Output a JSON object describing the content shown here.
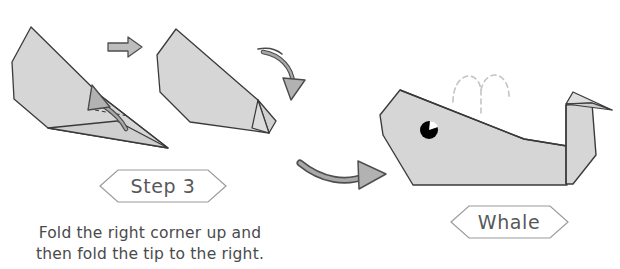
{
  "page": {
    "background_color": "#ffffff",
    "width": 620,
    "height": 269,
    "kind": "origami-instruction-diagram"
  },
  "colors": {
    "paper_fill": "#d4d4d4",
    "paper_fill_light": "#dedede",
    "paper_stroke": "#3a3a3a",
    "arrow_fill": "#b0b0b0",
    "arrow_stroke": "#4a4a4a",
    "label_outline": "#9a9a9a",
    "label_text": "#58585a",
    "caption_text": "#4a4a4c",
    "eye_fill": "#000000",
    "eye_highlight": "#ffffff",
    "spout_dash": "#c4c4c4"
  },
  "step_label": {
    "text": "Step 3",
    "shape": "hexagon"
  },
  "result_label": {
    "text": "Whale",
    "shape": "hexagon"
  },
  "caption": {
    "line1": "Fold the right corner up and",
    "line2": "then fold the tip to the right."
  },
  "figures": [
    {
      "id": "figure-before-fold",
      "name": "origami-step3-before",
      "description": "Elongated folded paper with long pointed tip to lower right",
      "fold_arrow": "curved-arrow-up",
      "fold_line": "dashed"
    },
    {
      "id": "figure-after-fold",
      "name": "origami-step3-after",
      "description": "Paper with right corner folded up forming a tail",
      "fold_arrow": "curved-arrow-down-right"
    },
    {
      "id": "figure-whale",
      "name": "origami-finished-whale",
      "description": "Completed origami whale with eye, tail fluke and water spout",
      "features": [
        "body",
        "eye",
        "tail",
        "fluke",
        "water-spout"
      ]
    }
  ],
  "arrows": [
    {
      "id": "arrow-small-right",
      "name": "small-right-arrow",
      "direction": "right"
    },
    {
      "id": "arrow-large-curved",
      "name": "large-curved-right-arrow",
      "direction": "right"
    }
  ]
}
